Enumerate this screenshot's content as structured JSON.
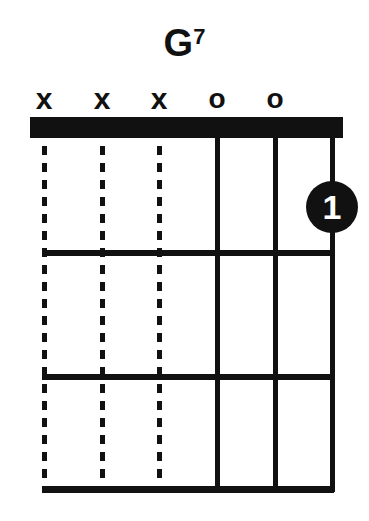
{
  "chord": {
    "root": "G",
    "extension": "7",
    "name": "G7"
  },
  "diagram": {
    "string_markers": [
      "x",
      "x",
      "x",
      "o",
      "o",
      ""
    ],
    "string_states": [
      "muted",
      "muted",
      "muted",
      "open",
      "open",
      "fretted"
    ],
    "frets_shown": 3,
    "fingers": [
      {
        "string": 6,
        "fret": 1,
        "label": "1"
      }
    ],
    "colors": {
      "ink": "#111111",
      "background": "#ffffff",
      "finger_text": "#ffffff"
    }
  }
}
